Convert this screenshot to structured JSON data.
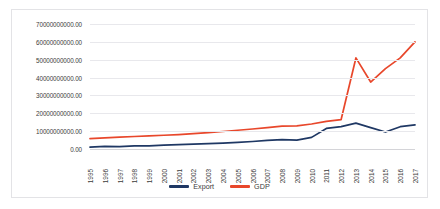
{
  "chart_data": {
    "type": "line",
    "title": "",
    "xlabel": "",
    "ylabel": "",
    "categories": [
      "1995",
      "1996",
      "1997",
      "1998",
      "1999",
      "2000",
      "2001",
      "2002",
      "2003",
      "2004",
      "2005",
      "2006",
      "2007",
      "2008",
      "2009",
      "2010",
      "2011",
      "2012",
      "2013",
      "2014",
      "2015",
      "2016",
      "2017"
    ],
    "ylim": [
      0,
      70000000000
    ],
    "ytick_values": [
      70000000000,
      60000000000,
      50000000000,
      40000000000,
      30000000000,
      20000000000,
      10000000000,
      0
    ],
    "ytick_labels": [
      "70000000000.00",
      "60000000000.00",
      "50000000000.00",
      "40000000000.00",
      "30000000000.00",
      "20000000000.00",
      "10000000000.00",
      "0.00"
    ],
    "grid": true,
    "legend_position": "bottom",
    "series": [
      {
        "name": "Export",
        "color": "#1f3864",
        "values": [
          1000000000,
          1500000000,
          1300000000,
          1800000000,
          1700000000,
          2200000000,
          2400000000,
          2700000000,
          3000000000,
          3300000000,
          3700000000,
          4200000000,
          4800000000,
          5200000000,
          5000000000,
          6500000000,
          11500000000,
          12500000000,
          14500000000,
          12000000000,
          9500000000,
          12500000000,
          13500000000
        ]
      },
      {
        "name": "GDP",
        "color": "#e8472b",
        "values": [
          5800000000,
          6200000000,
          6600000000,
          7000000000,
          7300000000,
          7700000000,
          8100000000,
          8600000000,
          9200000000,
          9800000000,
          10500000000,
          11200000000,
          12000000000,
          12800000000,
          13000000000,
          14000000000,
          15500000000,
          16500000000,
          51000000000,
          37500000000,
          45000000000,
          51000000000,
          60000000000
        ]
      }
    ]
  },
  "legend": {
    "items": [
      {
        "label": "Export",
        "color": "#1f3864"
      },
      {
        "label": "GDP",
        "color": "#e8472b"
      }
    ]
  }
}
